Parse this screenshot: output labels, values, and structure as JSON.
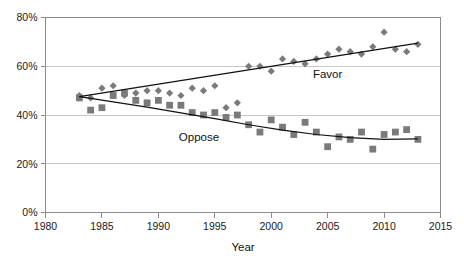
{
  "chart_data": {
    "type": "scatter",
    "title": "",
    "xlabel": "Year",
    "ylabel": "",
    "xlim": [
      1980,
      2015
    ],
    "ylim": [
      0,
      80
    ],
    "grid": true,
    "legend_position": "inline-annotation",
    "xticks": [
      1980,
      1985,
      1990,
      1995,
      2000,
      2005,
      2010,
      2015
    ],
    "xtick_labels": [
      "1980",
      "1985",
      "1990",
      "1995",
      "2000",
      "2005",
      "2010",
      "2015"
    ],
    "yticks": [
      0,
      20,
      40,
      60,
      80
    ],
    "ytick_labels": [
      "0%",
      "20%",
      "40%",
      "60%",
      "80%"
    ],
    "annotations": [
      {
        "text": "Favor",
        "x": 2005.0,
        "y": 55.0
      },
      {
        "text": "Oppose",
        "x": 1993.6,
        "y": 29.5
      }
    ],
    "series": [
      {
        "name": "Favor",
        "marker": "diamond",
        "color": "#7a7a7a",
        "trendline": "linear",
        "x": [
          1983,
          1984,
          1985,
          1986,
          1987,
          1988,
          1989,
          1990,
          1991,
          1992,
          1993,
          1994,
          1995,
          1996,
          1997,
          1998,
          1999,
          2000,
          2001,
          2002,
          2003,
          2004,
          2005,
          2006,
          2007,
          2008,
          2009,
          2010,
          2011,
          2012,
          2013
        ],
        "values": [
          48,
          47,
          51,
          52,
          48,
          49,
          50,
          50,
          49,
          48,
          51,
          50,
          52,
          43,
          45,
          60,
          60,
          58,
          63,
          62,
          61,
          63,
          65,
          67,
          66,
          65,
          68,
          74,
          67,
          66,
          69
        ]
      },
      {
        "name": "Oppose",
        "marker": "square",
        "color": "#7a7a7a",
        "trendline": "polynomial",
        "x": [
          1983,
          1984,
          1985,
          1986,
          1987,
          1988,
          1989,
          1990,
          1991,
          1992,
          1993,
          1994,
          1995,
          1996,
          1997,
          1998,
          1999,
          2000,
          2001,
          2002,
          2003,
          2004,
          2005,
          2006,
          2007,
          2008,
          2009,
          2010,
          2011,
          2012,
          2013
        ],
        "values": [
          47,
          42,
          43,
          48,
          49,
          46,
          45,
          46,
          44,
          44,
          41,
          40,
          41,
          39,
          40,
          36,
          33,
          38,
          35,
          32,
          37,
          33,
          27,
          31,
          30,
          33,
          26,
          32,
          33,
          34,
          30
        ]
      }
    ],
    "trendlines": [
      {
        "name": "Favor trend",
        "type": "linear",
        "x_start": 1983,
        "y_start": 47.5,
        "x_end": 2013,
        "y_end": 69.5
      },
      {
        "name": "Oppose trend",
        "type": "polynomial",
        "points": [
          [
            1983,
            47.5
          ],
          [
            1986,
            45.4
          ],
          [
            1989,
            43.2
          ],
          [
            1992,
            40.9
          ],
          [
            1995,
            38.5
          ],
          [
            1998,
            36.0
          ],
          [
            2001,
            33.8
          ],
          [
            2004,
            32.0
          ],
          [
            2007,
            30.7
          ],
          [
            2010,
            30.0
          ],
          [
            2013,
            30.2
          ]
        ]
      }
    ]
  }
}
